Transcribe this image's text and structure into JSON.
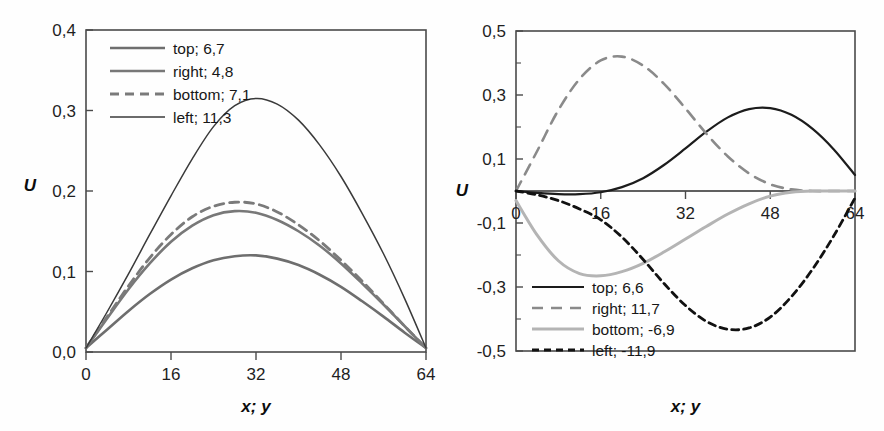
{
  "figure": {
    "background": "#fefefe",
    "panel_count": 2
  },
  "chart_data": [
    {
      "id": "left-chart",
      "type": "line",
      "title": "",
      "xlabel": "x; y",
      "ylabel": "U",
      "xlim": [
        0,
        64
      ],
      "ylim": [
        0.0,
        0.4
      ],
      "xticks": [
        0,
        16,
        32,
        48,
        64
      ],
      "xticklabels": [
        "0",
        "16",
        "32",
        "48",
        "64"
      ],
      "yticks": [
        0.0,
        0.1,
        0.2,
        0.3,
        0.4
      ],
      "yticklabels": [
        "0,0",
        "0,1",
        "0,2",
        "0,3",
        "0,4"
      ],
      "grid": false,
      "legend_position": "upper-left",
      "series": [
        {
          "name": "top; 6,7",
          "label": "top; 6,7",
          "color": "#6e6e6e",
          "width": 2.6,
          "dash": "none",
          "x": [
            0,
            4,
            8,
            12,
            16,
            20,
            24,
            28,
            32,
            36,
            40,
            44,
            48,
            52,
            56,
            60,
            64
          ],
          "y": [
            0.005,
            0.028,
            0.051,
            0.072,
            0.09,
            0.104,
            0.114,
            0.119,
            0.12,
            0.116,
            0.108,
            0.096,
            0.081,
            0.063,
            0.044,
            0.024,
            0.005
          ]
        },
        {
          "name": "right; 4,8",
          "label": "right; 4,8",
          "color": "#787878",
          "width": 2.6,
          "dash": "none",
          "x": [
            0,
            4,
            8,
            12,
            16,
            20,
            24,
            28,
            32,
            36,
            40,
            44,
            48,
            52,
            56,
            60,
            64
          ],
          "y": [
            0.005,
            0.042,
            0.078,
            0.11,
            0.137,
            0.157,
            0.17,
            0.175,
            0.173,
            0.164,
            0.15,
            0.132,
            0.11,
            0.085,
            0.059,
            0.032,
            0.005
          ]
        },
        {
          "name": "bottom; 7,1",
          "label": "bottom; 7,1",
          "color": "#7a7a7a",
          "width": 2.8,
          "dash": "9,6",
          "x": [
            0,
            4,
            8,
            12,
            16,
            20,
            24,
            28,
            32,
            36,
            40,
            44,
            48,
            52,
            56,
            60,
            64
          ],
          "y": [
            0.005,
            0.044,
            0.082,
            0.117,
            0.146,
            0.168,
            0.181,
            0.186,
            0.184,
            0.174,
            0.158,
            0.138,
            0.114,
            0.088,
            0.06,
            0.032,
            0.005
          ]
        },
        {
          "name": "left; 11,3",
          "label": "left; 11,3",
          "color": "#3a3a3a",
          "width": 1.5,
          "dash": "none",
          "x": [
            0,
            4,
            8,
            12,
            16,
            20,
            24,
            28,
            32,
            36,
            40,
            44,
            48,
            52,
            56,
            60,
            64
          ],
          "y": [
            0.005,
            0.05,
            0.097,
            0.146,
            0.194,
            0.24,
            0.28,
            0.306,
            0.315,
            0.308,
            0.288,
            0.257,
            0.218,
            0.172,
            0.122,
            0.066,
            0.005
          ]
        }
      ]
    },
    {
      "id": "right-chart",
      "type": "line",
      "title": "",
      "xlabel": "x; y",
      "ylabel": "U",
      "xlim": [
        0,
        64
      ],
      "ylim": [
        -0.5,
        0.5
      ],
      "xticks": [
        0,
        16,
        32,
        48,
        64
      ],
      "xticklabels": [
        "0",
        "16",
        "32",
        "48",
        "64"
      ],
      "yticks": [
        -0.5,
        -0.3,
        -0.1,
        0.1,
        0.3,
        0.5
      ],
      "yticklabels": [
        "-0,5",
        "-0,3",
        "-0,1",
        "0,1",
        "0,3",
        "0,5"
      ],
      "yminorticks": [
        -0.4,
        -0.2,
        0.0,
        0.2,
        0.4
      ],
      "grid": false,
      "legend_position": "lower-left",
      "series": [
        {
          "name": "top; 6,6",
          "label": "top; 6,6",
          "color": "#1c1c1c",
          "width": 2.2,
          "dash": "none",
          "x": [
            0,
            4,
            8,
            12,
            16,
            20,
            24,
            28,
            32,
            36,
            40,
            44,
            48,
            52,
            56,
            60,
            64
          ],
          "y": [
            0.0,
            -0.006,
            -0.01,
            -0.01,
            -0.004,
            0.012,
            0.04,
            0.082,
            0.133,
            0.186,
            0.23,
            0.256,
            0.259,
            0.238,
            0.194,
            0.13,
            0.05
          ]
        },
        {
          "name": "right; 11,7",
          "label": "right; 11,7",
          "color": "#8a8a8a",
          "width": 2.6,
          "dash": "11,8",
          "x": [
            0,
            4,
            8,
            12,
            16,
            20,
            24,
            28,
            32,
            36,
            40,
            44,
            48,
            52,
            56,
            60,
            64
          ],
          "y": [
            0.0,
            0.125,
            0.253,
            0.35,
            0.408,
            0.42,
            0.392,
            0.334,
            0.258,
            0.178,
            0.108,
            0.055,
            0.021,
            0.005,
            0.0,
            0.0,
            0.0
          ]
        },
        {
          "name": "bottom; -6,9",
          "label": "bottom; -6,9",
          "color": "#b4b4b4",
          "width": 3.0,
          "dash": "none",
          "x": [
            0,
            4,
            8,
            12,
            16,
            20,
            24,
            28,
            32,
            36,
            40,
            44,
            48,
            52,
            56,
            60,
            64
          ],
          "y": [
            -0.03,
            -0.138,
            -0.218,
            -0.258,
            -0.265,
            -0.252,
            -0.226,
            -0.19,
            -0.15,
            -0.11,
            -0.072,
            -0.04,
            -0.016,
            -0.004,
            0.0,
            0.0,
            0.0
          ]
        },
        {
          "name": "left; -11,9",
          "label": "left; -11,9",
          "color": "#111111",
          "width": 2.8,
          "dash": "7,5",
          "x": [
            0,
            4,
            8,
            12,
            16,
            20,
            24,
            28,
            32,
            36,
            40,
            44,
            48,
            52,
            56,
            60,
            64
          ],
          "y": [
            0.0,
            -0.012,
            -0.03,
            -0.056,
            -0.09,
            -0.144,
            -0.214,
            -0.29,
            -0.358,
            -0.408,
            -0.432,
            -0.428,
            -0.394,
            -0.33,
            -0.244,
            -0.14,
            -0.022
          ]
        }
      ]
    }
  ]
}
